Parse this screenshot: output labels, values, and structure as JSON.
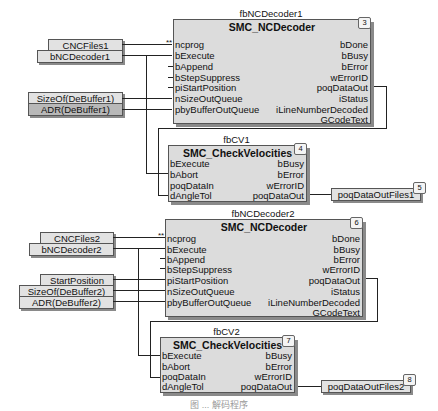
{
  "blocks": [
    {
      "id": "fbNCDecoder1",
      "instance": "fbNCDecoder1",
      "type": "SMC_NCDecoder",
      "number": "3",
      "inputs": [
        "ncprog",
        "bExecute",
        "bAppend",
        "bStepSuppress",
        "piStartPosition",
        "nSizeOutQueue",
        "pbyBufferOutQueue"
      ],
      "outputs": [
        "bDone",
        "bBusy",
        "bError",
        "wErrorID",
        "poqDataOut",
        "iStatus",
        "iLineNumberDecoded",
        "GCodeText"
      ]
    },
    {
      "id": "fbCV1",
      "instance": "fbCV1",
      "type": "SMC_CheckVelocities",
      "number": "4",
      "inputs": [
        "bExecute",
        "bAbort",
        "poqDataIn",
        "dAngleTol"
      ],
      "outputs": [
        "bBusy",
        "bError",
        "wErrorID",
        "poqDataOut"
      ]
    },
    {
      "id": "fbNCDecoder2",
      "instance": "fbNCDecoder2",
      "type": "SMC_NCDecoder",
      "number": "6",
      "inputs": [
        "ncprog",
        "bExecute",
        "bAppend",
        "bStepSuppress",
        "piStartPosition",
        "nSizeOutQueue",
        "pbyBufferOutQueue"
      ],
      "outputs": [
        "bDone",
        "bBusy",
        "bError",
        "wErrorID",
        "poqDataOut",
        "iStatus",
        "iLineNumberDecoded",
        "GCodeText"
      ]
    },
    {
      "id": "fbCV2",
      "instance": "fbCV2",
      "type": "SMC_CheckVelocities",
      "number": "7",
      "inputs": [
        "bExecute",
        "bAbort",
        "poqDataIn",
        "dAngleTol"
      ],
      "outputs": [
        "bBusy",
        "bError",
        "wErrorID",
        "poqDataOut"
      ]
    }
  ],
  "variables": {
    "cncfiles1": "CNCFiles1",
    "bncdecoder1": "bNCDecoder1",
    "sizeof1": "SizeOf(DeBuffer1)",
    "adr1": "ADR(DeBuffer1)",
    "out1": "poqDataOutFiles1",
    "out1_num": "5",
    "cncfiles2": "CNCFiles2",
    "bncdecoder2": "bNCDecoder2",
    "startpos": "StartPosition",
    "sizeof2": "SizeOf(DeBuffer2)",
    "adr2": "ADR(DeBuffer2)",
    "out2": "poqDataOutFiles2",
    "out2_num": "8"
  },
  "markers": {
    "double_star": "**"
  },
  "caption": "图 ...  解码程序"
}
